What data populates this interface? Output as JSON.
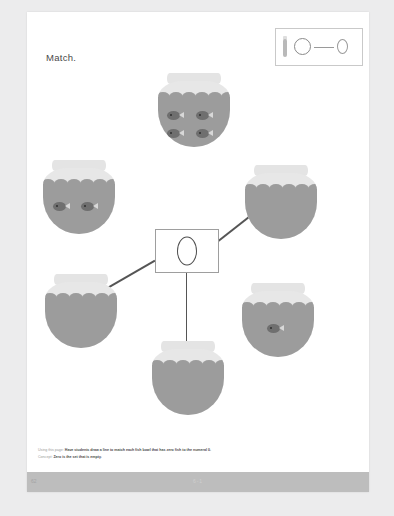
{
  "worksheet": {
    "title": "Match.",
    "center_numeral": "0"
  },
  "key": {
    "numeral": "0",
    "bowl_icon": "fish-bowl-icon",
    "circle_icon": "circle-icon",
    "line_icon": "connector-line-icon"
  },
  "bowls": [
    {
      "id": "bowl-top-center",
      "fish_count": 4,
      "matched": false,
      "label": "4 fish"
    },
    {
      "id": "bowl-left-upper",
      "fish_count": 2,
      "matched": false,
      "label": "2 fish"
    },
    {
      "id": "bowl-right-upper",
      "fish_count": 0,
      "matched": true,
      "label": "0 fish"
    },
    {
      "id": "bowl-left-lower",
      "fish_count": 0,
      "matched": true,
      "label": "0 fish"
    },
    {
      "id": "bowl-right-lower",
      "fish_count": 1,
      "matched": false,
      "label": "1 fish"
    },
    {
      "id": "bowl-bottom-center",
      "fish_count": 0,
      "matched": true,
      "label": "0 fish"
    }
  ],
  "footer": {
    "using_label": "Using this page:",
    "using_text": "Have students draw a line to match each fish bowl that has zero fish to the numeral 0.",
    "concept_label": "Concept:",
    "concept_text": "Zero is the set that is empty.",
    "page_number": "62",
    "lesson_code": "6-1"
  },
  "colors": {
    "page": "#ffffff",
    "backdrop": "#ececed",
    "water": "#9c9c9c",
    "bowl_glass": "#e7e7e7",
    "fish": "#6f6f6f",
    "connector": "#555555",
    "footer_bar": "#bdbdbd"
  }
}
